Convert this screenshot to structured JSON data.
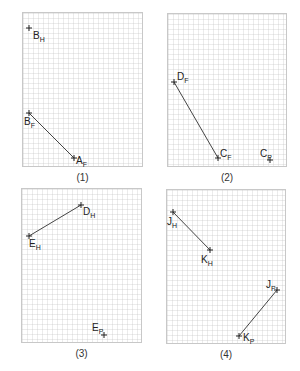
{
  "panels": [
    {
      "caption": "(1)",
      "box": [
        22,
        12,
        121,
        155
      ],
      "points": [
        {
          "id": "BH",
          "base": "B",
          "sub": "H",
          "x": 29,
          "y": 28,
          "lx": 33,
          "ly": 31
        },
        {
          "id": "BF",
          "base": "B",
          "sub": "F",
          "x": 29,
          "y": 113,
          "lx": 24,
          "ly": 117
        },
        {
          "id": "AF",
          "base": "A",
          "sub": "F",
          "x": 74,
          "y": 158,
          "lx": 76,
          "ly": 156
        }
      ],
      "segments": [
        [
          "BF",
          "AF"
        ]
      ]
    },
    {
      "caption": "(2)",
      "box": [
        167,
        13,
        120,
        154
      ],
      "points": [
        {
          "id": "DF",
          "base": "D",
          "sub": "F",
          "x": 174,
          "y": 82,
          "lx": 177,
          "ly": 72
        },
        {
          "id": "CF",
          "base": "C",
          "sub": "F",
          "x": 218,
          "y": 158,
          "lx": 220,
          "ly": 149
        },
        {
          "id": "CP",
          "base": "C",
          "sub": "P",
          "x": 270,
          "y": 160,
          "lx": 260,
          "ly": 149
        }
      ],
      "segments": [
        [
          "DF",
          "CF"
        ]
      ]
    },
    {
      "caption": "(3)",
      "box": [
        21,
        188,
        121,
        155
      ],
      "points": [
        {
          "id": "DH",
          "base": "D",
          "sub": "H",
          "x": 81,
          "y": 205,
          "lx": 83,
          "ly": 207
        },
        {
          "id": "EH",
          "base": "E",
          "sub": "H",
          "x": 29,
          "y": 236,
          "lx": 29,
          "ly": 239
        },
        {
          "id": "EP",
          "base": "E",
          "sub": "P",
          "x": 104,
          "y": 335,
          "lx": 92,
          "ly": 323
        }
      ],
      "segments": [
        [
          "DH",
          "EH"
        ]
      ]
    },
    {
      "caption": "(4)",
      "box": [
        166,
        189,
        120,
        155
      ],
      "points": [
        {
          "id": "JH",
          "base": "J",
          "sub": "H",
          "x": 173,
          "y": 212,
          "lx": 167,
          "ly": 217
        },
        {
          "id": "KH",
          "base": "K",
          "sub": "H",
          "x": 210,
          "y": 250,
          "lx": 201,
          "ly": 255
        },
        {
          "id": "JP",
          "base": "J",
          "sub": "P",
          "x": 277,
          "y": 290,
          "lx": 266,
          "ly": 280
        },
        {
          "id": "KP",
          "base": "K",
          "sub": "P",
          "x": 239,
          "y": 336,
          "lx": 243,
          "ly": 333
        }
      ],
      "segments": [
        [
          "JH",
          "KH"
        ],
        [
          "JP",
          "KP"
        ]
      ]
    }
  ],
  "colors": {
    "line": "#444444",
    "marker": "#222222",
    "grid": "#e6e6e6",
    "border": "#c8c8c8"
  }
}
